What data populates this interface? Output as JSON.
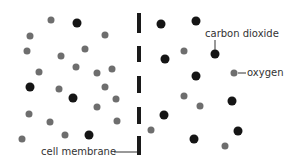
{
  "labels": {
    "carbon_dioxide": "carbon dioxide",
    "oxygen": "oxygen",
    "cell_membrane": "cell membrane"
  },
  "colors": {
    "oxygen": "#6e6e6e",
    "carbon_dioxide": "#151515",
    "membrane": "#1a1a1a",
    "label": "#333333"
  },
  "membrane": {
    "x": 139,
    "dashes": [
      [
        13,
        33
      ],
      [
        46,
        62
      ],
      [
        76,
        93
      ],
      [
        107,
        124
      ],
      [
        136,
        155
      ]
    ]
  },
  "molecules": [
    {
      "t": "o",
      "x": 51,
      "y": 20
    },
    {
      "t": "c",
      "x": 77,
      "y": 23
    },
    {
      "t": "o",
      "x": 30,
      "y": 36
    },
    {
      "t": "o",
      "x": 105,
      "y": 35
    },
    {
      "t": "o",
      "x": 27,
      "y": 51
    },
    {
      "t": "o",
      "x": 61,
      "y": 56
    },
    {
      "t": "o",
      "x": 85,
      "y": 49
    },
    {
      "t": "o",
      "x": 39,
      "y": 72
    },
    {
      "t": "o",
      "x": 76,
      "y": 67
    },
    {
      "t": "o",
      "x": 97,
      "y": 73
    },
    {
      "t": "o",
      "x": 112,
      "y": 69
    },
    {
      "t": "c",
      "x": 30,
      "y": 87
    },
    {
      "t": "o",
      "x": 59,
      "y": 89
    },
    {
      "t": "o",
      "x": 105,
      "y": 87
    },
    {
      "t": "c",
      "x": 73,
      "y": 98
    },
    {
      "t": "o",
      "x": 116,
      "y": 99
    },
    {
      "t": "o",
      "x": 97,
      "y": 107
    },
    {
      "t": "o",
      "x": 29,
      "y": 114
    },
    {
      "t": "o",
      "x": 50,
      "y": 122
    },
    {
      "t": "o",
      "x": 117,
      "y": 121
    },
    {
      "t": "o",
      "x": 22,
      "y": 139
    },
    {
      "t": "o",
      "x": 65,
      "y": 135
    },
    {
      "t": "c",
      "x": 89,
      "y": 135
    },
    {
      "t": "c",
      "x": 161,
      "y": 24
    },
    {
      "t": "c",
      "x": 196,
      "y": 21
    },
    {
      "t": "o",
      "x": 184,
      "y": 51
    },
    {
      "t": "c",
      "x": 165,
      "y": 59
    },
    {
      "t": "c",
      "x": 215,
      "y": 54
    },
    {
      "t": "c",
      "x": 196,
      "y": 76
    },
    {
      "t": "o",
      "x": 234,
      "y": 73
    },
    {
      "t": "o",
      "x": 184,
      "y": 96
    },
    {
      "t": "o",
      "x": 200,
      "y": 106
    },
    {
      "t": "c",
      "x": 232,
      "y": 101
    },
    {
      "t": "c",
      "x": 164,
      "y": 115
    },
    {
      "t": "c",
      "x": 238,
      "y": 131
    },
    {
      "t": "o",
      "x": 151,
      "y": 130
    },
    {
      "t": "c",
      "x": 194,
      "y": 139
    },
    {
      "t": "o",
      "x": 225,
      "y": 146
    }
  ]
}
